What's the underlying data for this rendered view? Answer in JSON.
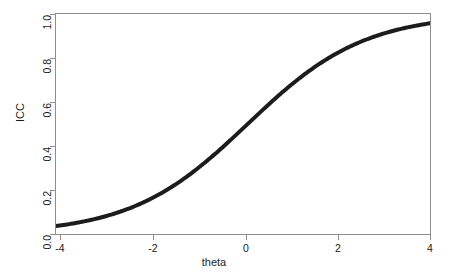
{
  "chart_data": {
    "type": "line",
    "title": "",
    "subtitle": "",
    "xlabel": "theta",
    "ylabel": "ICC",
    "xlim": [
      -4,
      4
    ],
    "ylim": [
      0.0,
      1.0
    ],
    "grid": false,
    "legend": null,
    "legend_position": "none",
    "x_ticks": [
      "-4",
      "-2",
      "0",
      "2",
      "4"
    ],
    "x_tick_values": [
      -4,
      -2,
      0,
      2,
      4
    ],
    "y_ticks": [
      "0.0",
      "0.2",
      "0.4",
      "0.6",
      "0.8",
      "1.0"
    ],
    "y_tick_values": [
      0.0,
      0.2,
      0.4,
      0.6,
      0.8,
      1.0
    ],
    "series": [
      {
        "name": "ICC",
        "color": "#1c1c1c",
        "line_width": 4,
        "model": "2PL logistic",
        "discrimination_a": 0.8,
        "difficulty_b": 0.1,
        "x": [
          -4.0,
          -3.75,
          -3.5,
          -3.25,
          -3.0,
          -2.75,
          -2.5,
          -2.25,
          -2.0,
          -1.75,
          -1.5,
          -1.25,
          -1.0,
          -0.75,
          -0.5,
          -0.25,
          0.0,
          0.25,
          0.5,
          0.75,
          1.0,
          1.25,
          1.5,
          1.75,
          2.0,
          2.25,
          2.5,
          2.75,
          3.0,
          3.25,
          3.5,
          3.75,
          4.0
        ],
        "values": [
          0.045,
          0.055,
          0.066,
          0.08,
          0.097,
          0.116,
          0.139,
          0.166,
          0.198,
          0.234,
          0.274,
          0.319,
          0.368,
          0.42,
          0.473,
          0.527,
          0.48,
          0.633,
          0.682,
          0.727,
          0.768,
          0.804,
          0.835,
          0.862,
          0.885,
          0.904,
          0.921,
          0.934,
          0.946,
          0.955,
          0.963,
          0.97,
          0.975
        ]
      }
    ],
    "axis_color": "#8e8e8e",
    "background": "#ffffff"
  },
  "axes": {
    "x_title": "theta",
    "y_title": "ICC",
    "x_tick_labels": [
      "-4",
      "-2",
      "0",
      "2",
      "4"
    ],
    "y_tick_labels": [
      "0.0",
      "0.2",
      "0.4",
      "0.6",
      "0.8",
      "1.0"
    ]
  }
}
